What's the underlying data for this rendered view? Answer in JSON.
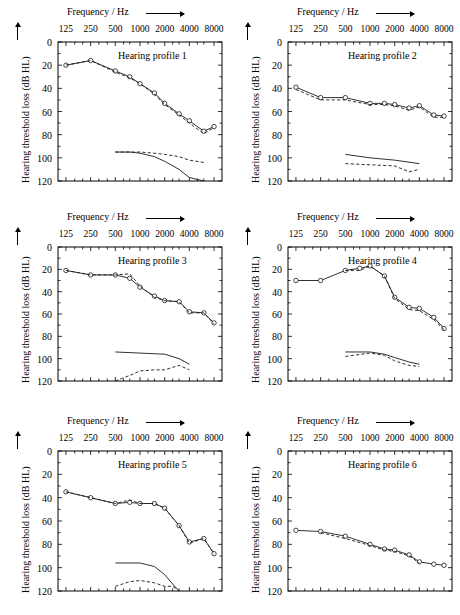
{
  "figure": {
    "x_axis_caption": "Frequency / Hz",
    "y_axis_caption": "Hearing threshold loss (dB HL)",
    "x_tick_labels": [
      "125",
      "250",
      "500",
      "1000",
      "2000",
      "4000",
      "8000"
    ],
    "y_tick_labels": [
      "0",
      "20",
      "40",
      "60",
      "80",
      "100",
      "120"
    ]
  },
  "chart_data": [
    {
      "type": "line",
      "title": "Hearing profile 1",
      "xlabel": "Frequency / Hz",
      "ylabel": "Hearing threshold loss (dB HL)",
      "xscale": "log",
      "x_ticks": [
        125,
        250,
        500,
        1000,
        2000,
        4000,
        8000
      ],
      "ylim": [
        0,
        120
      ],
      "y_ticks": [
        0,
        20,
        40,
        60,
        80,
        100,
        120
      ],
      "y_inverted": true,
      "grid": false,
      "legend": "none",
      "series": [
        {
          "name": "threshold-solid-markers",
          "style": "solid-with-circles",
          "x": [
            125,
            250,
            500,
            750,
            1000,
            1500,
            2000,
            3000,
            4000,
            6000,
            8000
          ],
          "values": [
            20,
            16,
            25,
            30,
            36,
            44,
            53,
            62,
            68,
            77,
            73
          ]
        },
        {
          "name": "threshold-dashed",
          "style": "dashed",
          "x": [
            125,
            250,
            500,
            750,
            1000,
            1500,
            2000,
            3000,
            4000,
            6000,
            8000
          ],
          "values": [
            20,
            16,
            26,
            31,
            36,
            45,
            54,
            63,
            70,
            79,
            74
          ]
        },
        {
          "name": "lower-solid",
          "style": "solid",
          "x": [
            500,
            750,
            1000,
            1500,
            2000,
            3000,
            4000,
            6000
          ],
          "values": [
            95,
            95,
            96,
            99,
            103,
            110,
            117,
            121
          ]
        },
        {
          "name": "lower-dashed",
          "style": "dashed",
          "x": [
            500,
            750,
            1000,
            1500,
            2000,
            3000,
            4000,
            6000
          ],
          "values": [
            95,
            95,
            95,
            96,
            97,
            99,
            102,
            104
          ]
        }
      ]
    },
    {
      "type": "line",
      "title": "Hearing profile 2",
      "xlabel": "Frequency / Hz",
      "ylabel": "Hearing threshold loss (dB HL)",
      "xscale": "log",
      "x_ticks": [
        125,
        250,
        500,
        1000,
        2000,
        4000,
        8000
      ],
      "ylim": [
        0,
        120
      ],
      "y_ticks": [
        0,
        20,
        40,
        60,
        80,
        100,
        120
      ],
      "y_inverted": true,
      "grid": false,
      "legend": "none",
      "series": [
        {
          "name": "threshold-solid-markers",
          "style": "solid-with-circles",
          "x": [
            125,
            250,
            500,
            1000,
            1500,
            2000,
            3000,
            4000,
            6000,
            8000
          ],
          "values": [
            39,
            48,
            48,
            53,
            53,
            54,
            57,
            55,
            63,
            64
          ]
        },
        {
          "name": "threshold-dashed",
          "style": "dashed",
          "x": [
            125,
            250,
            500,
            1000,
            1500,
            2000,
            3000,
            4000,
            6000,
            8000
          ],
          "values": [
            41,
            50,
            50,
            54,
            54,
            55,
            59,
            56,
            65,
            65
          ]
        },
        {
          "name": "lower-solid",
          "style": "solid",
          "x": [
            500,
            1000,
            2000,
            4000
          ],
          "values": [
            97,
            100,
            102,
            105
          ]
        },
        {
          "name": "lower-dashed",
          "style": "dashed",
          "x": [
            500,
            1000,
            2000,
            3000,
            4000
          ],
          "values": [
            105,
            106,
            107,
            112,
            110
          ]
        }
      ]
    },
    {
      "type": "line",
      "title": "Hearing profile 3",
      "xlabel": "Frequency / Hz",
      "ylabel": "Hearing threshold loss (dB HL)",
      "xscale": "log",
      "x_ticks": [
        125,
        250,
        500,
        1000,
        2000,
        4000,
        8000
      ],
      "ylim": [
        0,
        120
      ],
      "y_ticks": [
        0,
        20,
        40,
        60,
        80,
        100,
        120
      ],
      "y_inverted": true,
      "grid": false,
      "legend": "none",
      "series": [
        {
          "name": "threshold-solid-markers",
          "style": "solid-with-circles",
          "x": [
            125,
            250,
            500,
            750,
            1000,
            1500,
            2000,
            3000,
            4000,
            6000,
            8000
          ],
          "values": [
            21,
            25,
            25,
            28,
            36,
            44,
            48,
            49,
            58,
            59,
            68
          ]
        },
        {
          "name": "threshold-dashed",
          "style": "dashed",
          "x": [
            125,
            250,
            500,
            750,
            1000,
            1500,
            2000,
            3000,
            4000,
            6000,
            8000
          ],
          "values": [
            21,
            25,
            25,
            24,
            35,
            45,
            48,
            49,
            59,
            59,
            69
          ]
        },
        {
          "name": "lower-solid",
          "style": "solid",
          "x": [
            500,
            1000,
            2000,
            3000,
            4000
          ],
          "values": [
            94,
            95,
            96,
            100,
            105
          ]
        },
        {
          "name": "lower-dashed",
          "style": "dashed",
          "x": [
            500,
            750,
            1000,
            1500,
            2000,
            3000,
            4000
          ],
          "values": [
            120,
            115,
            111,
            110,
            110,
            106,
            110
          ]
        }
      ]
    },
    {
      "type": "line",
      "title": "Hearing profile 4",
      "xlabel": "Frequency / Hz",
      "ylabel": "Hearing threshold loss (dB HL)",
      "xscale": "log",
      "x_ticks": [
        125,
        250,
        500,
        1000,
        2000,
        4000,
        8000
      ],
      "ylim": [
        0,
        120
      ],
      "y_ticks": [
        0,
        20,
        40,
        60,
        80,
        100,
        120
      ],
      "y_inverted": true,
      "grid": false,
      "legend": "none",
      "series": [
        {
          "name": "threshold-solid-markers",
          "style": "solid-with-circles",
          "x": [
            125,
            250,
            500,
            750,
            1000,
            1500,
            2000,
            3000,
            4000,
            6000,
            8000
          ],
          "values": [
            30,
            30,
            21,
            19,
            17,
            26,
            45,
            54,
            55,
            63,
            73
          ]
        },
        {
          "name": "threshold-dashed",
          "style": "dashed",
          "x": [
            500,
            750,
            1000,
            1500,
            2000,
            3000,
            4000,
            6000,
            8000
          ],
          "values": [
            21,
            21,
            17,
            26,
            46,
            56,
            57,
            65,
            74
          ]
        },
        {
          "name": "lower-solid",
          "style": "solid",
          "x": [
            500,
            1000,
            1500,
            2000,
            3000,
            4000
          ],
          "values": [
            94,
            94,
            96,
            99,
            103,
            105
          ]
        },
        {
          "name": "lower-dashed",
          "style": "dashed",
          "x": [
            500,
            1000,
            1500,
            2000,
            3000,
            4000
          ],
          "values": [
            98,
            95,
            97,
            102,
            106,
            107
          ]
        }
      ]
    },
    {
      "type": "line",
      "title": "Hearing profile 5",
      "xlabel": "Frequency / Hz",
      "ylabel": "Hearing threshold loss (dB HL)",
      "xscale": "log",
      "x_ticks": [
        125,
        250,
        500,
        1000,
        2000,
        4000,
        8000
      ],
      "ylim": [
        0,
        120
      ],
      "y_ticks": [
        0,
        20,
        40,
        60,
        80,
        100,
        120
      ],
      "y_inverted": true,
      "grid": false,
      "legend": "none",
      "series": [
        {
          "name": "threshold-solid-markers",
          "style": "solid-with-circles",
          "x": [
            125,
            250,
            500,
            750,
            1000,
            1500,
            2000,
            3000,
            4000,
            6000,
            8000
          ],
          "values": [
            35,
            40,
            45,
            44,
            45,
            45,
            49,
            64,
            78,
            75,
            88
          ]
        },
        {
          "name": "threshold-dashed",
          "style": "dashed",
          "x": [
            125,
            250,
            500,
            750,
            1000,
            1500,
            2000,
            3000,
            4000,
            6000,
            8000
          ],
          "values": [
            35,
            40,
            45,
            42,
            45,
            45,
            49,
            64,
            79,
            75,
            88
          ]
        },
        {
          "name": "lower-solid",
          "style": "solid",
          "x": [
            500,
            1000,
            1500,
            2000,
            2500,
            3000
          ],
          "values": [
            96,
            96,
            99,
            106,
            114,
            120
          ]
        },
        {
          "name": "lower-dashed",
          "style": "dashed",
          "x": [
            500,
            750,
            1000,
            1500,
            2000,
            2500,
            3000
          ],
          "values": [
            116,
            112,
            111,
            113,
            116,
            116,
            120
          ]
        }
      ]
    },
    {
      "type": "line",
      "title": "Hearing profile 6",
      "xlabel": "Frequency / Hz",
      "ylabel": "Hearing threshold loss (dB HL)",
      "xscale": "log",
      "x_ticks": [
        125,
        250,
        500,
        1000,
        2000,
        4000,
        8000
      ],
      "ylim": [
        0,
        120
      ],
      "y_ticks": [
        0,
        20,
        40,
        60,
        80,
        100,
        120
      ],
      "y_inverted": true,
      "grid": false,
      "legend": "none",
      "series": [
        {
          "name": "threshold-solid-markers",
          "style": "solid-with-circles",
          "x": [
            125,
            250,
            500,
            1000,
            1500,
            2000,
            3000,
            4000,
            6000,
            8000
          ],
          "values": [
            68,
            69,
            73,
            80,
            84,
            85,
            89,
            95,
            97,
            98
          ]
        },
        {
          "name": "threshold-dashed",
          "style": "dashed",
          "x": [
            250,
            500,
            1000,
            1500,
            2000,
            3000,
            4000
          ],
          "values": [
            70,
            75,
            81,
            85,
            86,
            90,
            96
          ]
        }
      ]
    }
  ]
}
